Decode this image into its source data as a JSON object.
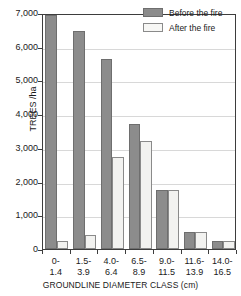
{
  "chart_data": {
    "type": "bar",
    "title": "",
    "subtitle": "",
    "xlabel": "GROUNDLINE DIAMETER CLASS (cm)",
    "ylabel": "TREES /ha",
    "categories": [
      "0-\n1.4",
      "1.5-\n3.9",
      "4.0-\n6.4",
      "6.5-\n8.9",
      "9.0-\n11.5",
      "11.6-\n13.9",
      "14.0-\n16.5"
    ],
    "category_lines": [
      [
        "0-",
        "1.4"
      ],
      [
        "1.5-",
        "3.9"
      ],
      [
        "4.0-",
        "6.4"
      ],
      [
        "6.5-",
        "8.9"
      ],
      [
        "9.0-",
        "11.5"
      ],
      [
        "11.6-",
        "13.9"
      ],
      [
        "14.0-",
        "16.5"
      ]
    ],
    "series": [
      {
        "name": "Before the fire",
        "color": "#8c8c8c",
        "values": [
          6950,
          6480,
          5650,
          3700,
          1760,
          510,
          250
        ]
      },
      {
        "name": "After the fire",
        "color": "#f2f2f0",
        "values": [
          250,
          430,
          2720,
          3200,
          1760,
          510,
          250
        ]
      }
    ],
    "ylim": [
      0,
      7000
    ],
    "yticks": [
      0,
      1000,
      2000,
      3000,
      4000,
      5000,
      6000,
      7000
    ],
    "ytick_labels": [
      "0",
      "1,000",
      "2,000",
      "3,000",
      "4,000",
      "5,000",
      "6,000",
      "7,000"
    ],
    "grid": true,
    "legend_position": "top-right"
  },
  "legend": {
    "items": [
      {
        "label": "Before the fire"
      },
      {
        "label": "After the fire"
      }
    ]
  }
}
